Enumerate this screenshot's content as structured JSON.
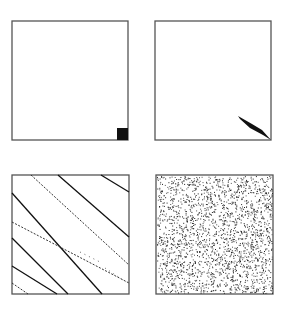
{
  "figure": {
    "background": "#ffffff",
    "frame_color": "#555555",
    "ink_color": "#111111",
    "panels": [
      {
        "id": "top-left",
        "description": "sparsity pattern: single dense block in bottom-right corner",
        "box": {
          "x": 12,
          "y": 21,
          "w": 116,
          "h": 119
        },
        "block": {
          "x": 117,
          "y": 128,
          "w": 11,
          "h": 12
        }
      },
      {
        "id": "top-right",
        "description": "sparsity pattern: thin diagonal band near bottom-right corner",
        "box": {
          "x": 155,
          "y": 21,
          "w": 116,
          "h": 119
        },
        "band": [
          [
            238,
            116
          ],
          [
            252,
            124
          ],
          [
            262,
            130
          ],
          [
            271,
            140
          ],
          [
            263,
            135
          ],
          [
            250,
            128
          ],
          [
            240,
            119
          ]
        ]
      },
      {
        "id": "bottom-left",
        "description": "sparsity pattern: parallel diagonal lines (banded)",
        "box": {
          "x": 12,
          "y": 175,
          "w": 117,
          "h": 119
        },
        "lines": [
          {
            "x1": 101,
            "y1": 175,
            "x2": 129,
            "y2": 192,
            "style": "solid"
          },
          {
            "x1": 58,
            "y1": 175,
            "x2": 129,
            "y2": 237,
            "style": "solid"
          },
          {
            "x1": 31,
            "y1": 175,
            "x2": 129,
            "y2": 265,
            "style": "dotted"
          },
          {
            "x1": 12,
            "y1": 193,
            "x2": 102,
            "y2": 294,
            "style": "solid"
          },
          {
            "x1": 12,
            "y1": 222,
            "x2": 129,
            "y2": 283,
            "style": "dotted"
          },
          {
            "x1": 12,
            "y1": 238,
            "x2": 68,
            "y2": 294,
            "style": "solid"
          },
          {
            "x1": 12,
            "y1": 266,
            "x2": 57,
            "y2": 294,
            "style": "solid"
          },
          {
            "x1": 12,
            "y1": 283,
            "x2": 28,
            "y2": 294,
            "style": "dotted"
          }
        ],
        "scatter_segments": [
          {
            "x1": 80,
            "y1": 252,
            "x2": 100,
            "y2": 262
          },
          {
            "x1": 105,
            "y1": 268,
            "x2": 126,
            "y2": 282
          }
        ]
      },
      {
        "id": "bottom-right",
        "description": "sparsity pattern: uniformly random scattered nonzeros",
        "box": {
          "x": 156,
          "y": 175,
          "w": 117,
          "h": 119
        },
        "random_dots": {
          "count": 2200,
          "seed": 7,
          "size": 1
        }
      }
    ]
  }
}
